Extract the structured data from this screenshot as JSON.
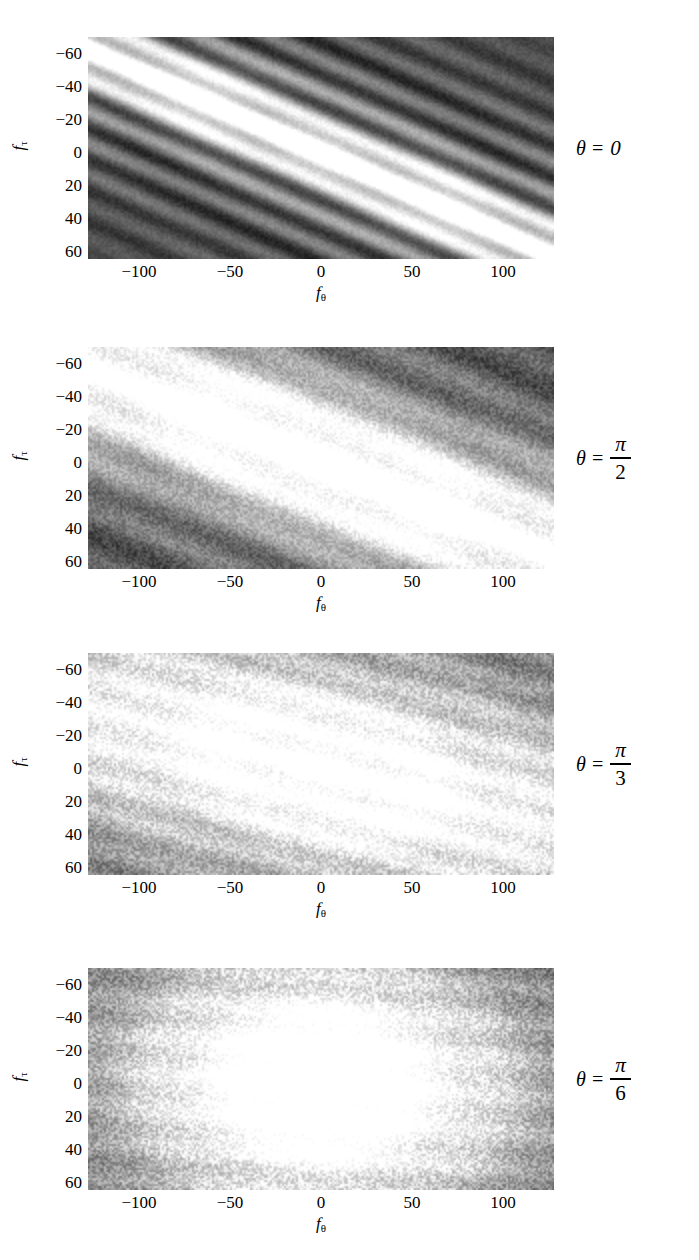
{
  "figure": {
    "type": "multi-panel-spectrogram-figure",
    "panel_count": 4,
    "colormap": "grayscale"
  },
  "axes": {
    "xlabel_base": "f",
    "xlabel_sub": "θ",
    "ylabel_base": "f",
    "ylabel_sub": "τ",
    "xticks": [
      "−100",
      "−50",
      "0",
      "50",
      "100"
    ],
    "xtick_values": [
      -100,
      -50,
      0,
      50,
      100
    ],
    "yticks": [
      "−60",
      "−40",
      "−20",
      "0",
      "20",
      "40",
      "60"
    ],
    "ytick_values": [
      -60,
      -40,
      -20,
      0,
      20,
      40,
      60
    ],
    "xlim": [
      -128,
      128
    ],
    "ylim": [
      -70,
      64
    ]
  },
  "panels": [
    {
      "id": "panel-theta-0",
      "annotation": {
        "lhs": "θ =",
        "value": "0",
        "is_fraction": false
      },
      "theta_label": "θ = 0",
      "theta_value": "0",
      "description": "Narrow bright diagonal ridge through origin with strong striation fringes"
    },
    {
      "id": "panel-theta-pi-over-2",
      "annotation": {
        "lhs": "θ =",
        "numerator": "π",
        "denominator": "2",
        "is_fraction": true
      },
      "theta_label": "θ = π/2",
      "theta_value": "π/2",
      "description": "Broad bright diagonal lobe, mottled noise texture"
    },
    {
      "id": "panel-theta-pi-over-3",
      "annotation": {
        "lhs": "θ =",
        "numerator": "π",
        "denominator": "3",
        "is_fraction": true
      },
      "theta_label": "θ = π/3",
      "theta_value": "π/3",
      "description": "Compact central blob, weak diagonal tilt, speckled background"
    },
    {
      "id": "panel-theta-pi-over-6",
      "annotation": {
        "lhs": "θ =",
        "numerator": "π",
        "denominator": "6",
        "is_fraction": true
      },
      "theta_label": "θ = π/6",
      "theta_value": "π/6",
      "description": "Nearly isotropic circular bright core on dark speckled background"
    }
  ],
  "chart_data": {
    "type": "heatmap",
    "title": "",
    "xlabel": "f_θ",
    "ylabel": "f_τ",
    "xlim": [
      -128,
      128
    ],
    "ylim": [
      -70,
      64
    ],
    "xticks": [
      -100,
      -50,
      0,
      50,
      100
    ],
    "yticks": [
      -60,
      -40,
      -20,
      0,
      20,
      40,
      60
    ],
    "grid": false,
    "legend": "none",
    "colormap": "gray",
    "panels": [
      {
        "theta": "0",
        "theta_numeric": 0.0,
        "peak_xy": [
          0,
          0
        ],
        "ridge_slope_deg": 26,
        "ridge_half_width": 12,
        "background_level": 0.3,
        "peak_level": 1.0,
        "striation_period": 17,
        "striation_amplitude": 0.26,
        "anisotropy": 0.95,
        "noise": 0.05
      },
      {
        "theta": "π/2",
        "theta_numeric": 1.5708,
        "peak_xy": [
          0,
          0
        ],
        "ridge_slope_deg": 24,
        "ridge_half_width": 30,
        "background_level": 0.26,
        "peak_level": 0.97,
        "striation_period": 26,
        "striation_amplitude": 0.1,
        "anisotropy": 0.8,
        "noise": 0.12
      },
      {
        "theta": "π/3",
        "theta_numeric": 1.0472,
        "peak_xy": [
          0,
          0
        ],
        "ridge_slope_deg": 16,
        "ridge_half_width": 48,
        "background_level": 0.3,
        "peak_level": 0.95,
        "striation_period": 20,
        "striation_amplitude": 0.07,
        "anisotropy": 0.45,
        "noise": 0.16
      },
      {
        "theta": "π/6",
        "theta_numeric": 0.5236,
        "peak_xy": [
          0,
          0
        ],
        "ridge_slope_deg": 4,
        "ridge_half_width": 62,
        "background_level": 0.12,
        "peak_level": 1.0,
        "striation_period": 22,
        "striation_amplitude": 0.05,
        "anisotropy": 0.15,
        "noise": 0.18
      }
    ]
  }
}
